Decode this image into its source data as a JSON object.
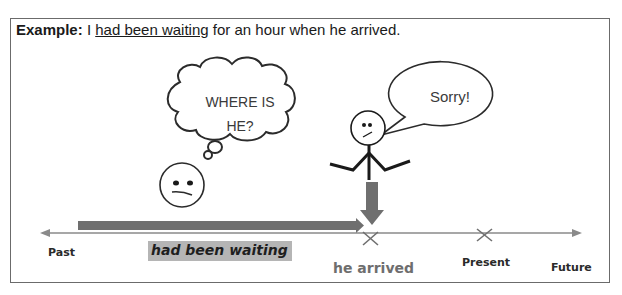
{
  "example": {
    "lead": "Example:",
    "subject": "I ",
    "highlight": "had been waiting",
    "rest": " for an hour when he arrived."
  },
  "thought_bubble": {
    "line1": "WHERE IS",
    "line2": "HE?"
  },
  "speech_bubble": {
    "text": "Sorry!"
  },
  "timeline": {
    "labels": {
      "past": "Past",
      "duration": "had been waiting",
      "event": "he arrived",
      "present": "Present",
      "future": "Future"
    }
  },
  "colors": {
    "line": "#8a8a8a",
    "bar": "#6f6f6f",
    "highlight": "#b5b5b5",
    "stroke": "#2b2b2b"
  }
}
